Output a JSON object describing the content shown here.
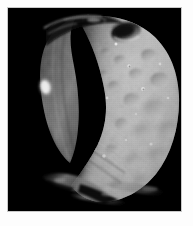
{
  "image": {
    "caption": "Phobos",
    "subject": "Phobos",
    "subject_type": "moon",
    "parent_body": "Mars",
    "view": "crescent-lit cratered body against black space",
    "alt_text": "Grayscale spacecraft photograph of the Martian moon Phobos, an irregular cratered body lit from the right, with a dark shadowed crescent limb at left and a large shadowed crater near the upper right.",
    "colorspace": "grayscale",
    "border": {
      "outer_color": "#fdfdfd",
      "matte_color": "#c9c9c9",
      "background_color": "#000000"
    },
    "palette": {
      "space_black": "#000000",
      "terminator_dark": "#1b1b1b",
      "shadow_gray": "#4a4a4a",
      "mid_gray": "#8f8f8f",
      "surface_gray": "#b0b0b0",
      "highlight_gray": "#d6d6d6",
      "specular_white": "#f2f2f2"
    },
    "features": [
      {
        "name": "large-shadowed-crater",
        "label": "Large shadowed crater",
        "position": "upper right"
      },
      {
        "name": "terminator",
        "label": "Terminator",
        "position": "running top-left to bottom-center"
      },
      {
        "name": "illuminated-crescent-limb",
        "label": "Illuminated crescent limb",
        "position": "left"
      },
      {
        "name": "bright-limb-highlight",
        "label": "Bright limb highlight",
        "position": "mid left"
      },
      {
        "name": "grooves",
        "label": "Surface grooves / striations",
        "position": "lower left"
      },
      {
        "name": "crater-field",
        "label": "Crater field",
        "position": "right hemisphere"
      },
      {
        "name": "lower-ridges",
        "label": "Dimly lit ridges",
        "position": "bottom"
      }
    ]
  }
}
